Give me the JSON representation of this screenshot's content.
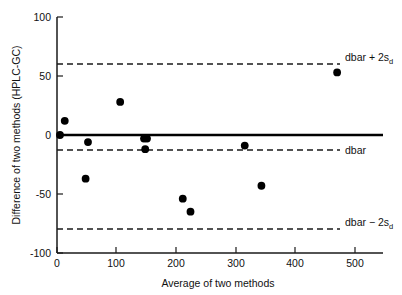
{
  "chart_data": {
    "type": "scatter",
    "title": "",
    "xlabel": "Average of two methods",
    "ylabel": "Difference of two methods (HPLC-GC)",
    "xlim": [
      0,
      540
    ],
    "ylim": [
      -100,
      100
    ],
    "grid": false,
    "legend_position": "right-inline-annotations",
    "x_ticks": [
      0,
      100,
      200,
      300,
      400,
      500
    ],
    "x_tick_labels": [
      "0",
      "100",
      "200",
      "300",
      "400",
      "500"
    ],
    "y_ticks": [
      100,
      50,
      0,
      -50,
      -100
    ],
    "y_tick_labels": [
      "100",
      "50",
      "0",
      "-50",
      "-100"
    ],
    "series": [
      {
        "name": "Method difference",
        "marker": "filled-circle",
        "color": "#000000",
        "points": [
          {
            "x": 5,
            "y": 0
          },
          {
            "x": 13,
            "y": 12
          },
          {
            "x": 48,
            "y": -37
          },
          {
            "x": 52,
            "y": -6
          },
          {
            "x": 106,
            "y": 28
          },
          {
            "x": 146,
            "y": -3
          },
          {
            "x": 151,
            "y": -3
          },
          {
            "x": 148,
            "y": -12
          },
          {
            "x": 211,
            "y": -54
          },
          {
            "x": 224,
            "y": -65
          },
          {
            "x": 315,
            "y": -9
          },
          {
            "x": 343,
            "y": -43
          },
          {
            "x": 470,
            "y": 53
          }
        ]
      }
    ],
    "reference_lines": [
      {
        "id": "upper-limit",
        "value": 57,
        "style": "dashed",
        "label": "dbar + 2s",
        "label_subscript": "d"
      },
      {
        "id": "mean-bias",
        "value": -12,
        "style": "dashed",
        "label": "dbar",
        "label_subscript": ""
      },
      {
        "id": "lower-limit",
        "value": -80,
        "style": "dashed",
        "label": "dbar − 2s",
        "label_subscript": "d"
      },
      {
        "id": "zero-line",
        "value": 0,
        "style": "solid",
        "label": "",
        "label_subscript": ""
      }
    ]
  },
  "annotations": {
    "upper_label": "dbar + 2s",
    "upper_sub": "d",
    "mean_label": "dbar",
    "lower_label": "dbar − 2s",
    "lower_sub": "d"
  },
  "axes": {
    "x_title": "Average of two methods",
    "y_title": "Difference of two methods (HPLC-GC)",
    "x_tick_0": "0",
    "x_tick_1": "100",
    "x_tick_2": "200",
    "x_tick_3": "300",
    "x_tick_4": "400",
    "x_tick_5": "500",
    "y_tick_0": "100",
    "y_tick_1": "50",
    "y_tick_2": "0",
    "y_tick_3": "-50",
    "y_tick_4": "-100"
  }
}
